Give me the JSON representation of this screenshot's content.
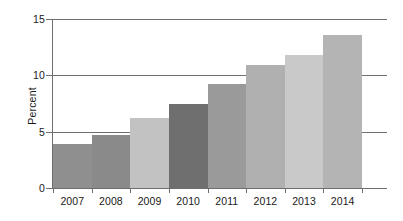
{
  "chart_data": {
    "type": "bar",
    "title": "",
    "subtitle": "",
    "xlabel": "",
    "ylabel": "Percent",
    "categories": [
      "2007",
      "2008",
      "2009",
      "2010",
      "2011",
      "2012",
      "2013",
      "2014"
    ],
    "values": [
      3.9,
      4.7,
      6.2,
      7.5,
      9.2,
      10.9,
      11.8,
      13.6
    ],
    "ylim": [
      0,
      15
    ],
    "yticks": [
      0,
      5,
      10,
      15
    ],
    "ytick_labels": [
      "0",
      "5",
      "10",
      "15"
    ],
    "grid": "horizontal",
    "legend": "none",
    "bar_colors": [
      "#8f8f8f",
      "#8a8a8a",
      "#c2c2c2",
      "#6f6f6f",
      "#9a9a9a",
      "#b0b0b0",
      "#c9c9c9",
      "#b4b4b4"
    ],
    "axis_color": "#6e6e6e",
    "background_color": "#ffffff",
    "text_color": "#1a1a1a"
  }
}
